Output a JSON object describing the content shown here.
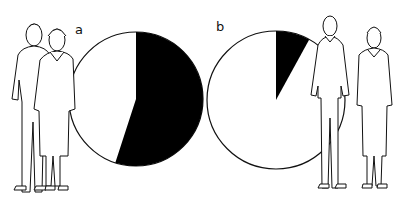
{
  "figure": {
    "panels": [
      {
        "label": "a",
        "black_share_pct": 55
      },
      {
        "label": "b",
        "black_share_pct": 8
      }
    ],
    "colors": {
      "slice": "#000000",
      "remainder": "#ffffff",
      "stroke": "#111111",
      "background": "#ffffff"
    }
  },
  "chart_data": [
    {
      "type": "pie",
      "title": "a",
      "categories": [
        "black segment",
        "white segment"
      ],
      "values": [
        55,
        45
      ],
      "start_angle": "12 o'clock, clockwise",
      "notes": "Couple (man and woman) illustrated to the left of the pie"
    },
    {
      "type": "pie",
      "title": "b",
      "categories": [
        "black segment",
        "white segment"
      ],
      "values": [
        8,
        92
      ],
      "start_angle": "12 o'clock, clockwise",
      "notes": "Two standing men illustrated to the right of the pie"
    }
  ]
}
